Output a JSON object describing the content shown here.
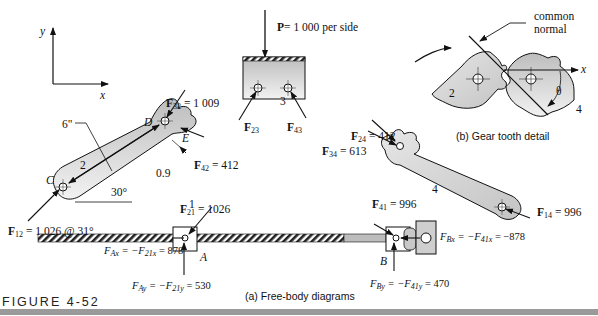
{
  "figure": {
    "number_label": "FIGURE 4-52",
    "caption_a": "(a)  Free-body diagrams",
    "caption_b": "(b) Gear tooth detail"
  },
  "axes": {
    "x_label": "x",
    "y_label": "y"
  },
  "slider_block": {
    "load_label": "P",
    "load_value": "= 1 000 per side",
    "link_number": "3",
    "force_23": "F",
    "force_23_sub": "23",
    "force_43": "F",
    "force_43_sub": "43"
  },
  "link2": {
    "link_number": "2",
    "point_c": "C",
    "point_d": "D",
    "point_e": "E",
    "length": "6\"",
    "offset": "0.9",
    "angle": "30°",
    "f32": {
      "sym": "F",
      "sub": "32",
      "value": " = 1 009"
    },
    "f42": {
      "sym": "F",
      "sub": "42",
      "value": " = 412"
    },
    "f12": {
      "sym": "F",
      "sub": "12",
      "value": " = 1 026 @ 31°"
    }
  },
  "link4": {
    "link_number": "4",
    "f24": {
      "sym": "F",
      "sub": "24",
      "value": " = 412"
    },
    "f34": {
      "sym": "F",
      "sub": "34",
      "value": " = 613"
    },
    "f14": {
      "sym": "F",
      "sub": "14",
      "value": " = 996"
    }
  },
  "link1": {
    "link_number": "1",
    "point_a": "A",
    "point_b": "B",
    "f21": {
      "sym": "F",
      "sub": "21",
      "value": " = 1026"
    },
    "f41": {
      "sym": "F",
      "sub": "41",
      "value": " = 996"
    },
    "fax": {
      "lhs": "F",
      "lhs_sub": "Ax",
      "mid": " = −F",
      "mid_sub": "21x",
      "value": " = 878"
    },
    "fay": {
      "lhs": "F",
      "lhs_sub": "Ay",
      "mid": " = −F",
      "mid_sub": "21y",
      "value": " = 530"
    },
    "fbx": {
      "lhs": "F",
      "lhs_sub": "Bx",
      "mid": " = −F",
      "mid_sub": "41x",
      "value": " = −878"
    },
    "fby": {
      "lhs": "F",
      "lhs_sub": "By",
      "mid": " = −F",
      "mid_sub": "41y",
      "value": " = 470"
    }
  },
  "gear_detail": {
    "label_common": "common",
    "label_normal": "normal",
    "gear_left": "2",
    "gear_right": "4",
    "angle": "θ",
    "x_label": "x"
  },
  "colors": {
    "part_fill": "#cfcfcf",
    "part_fill_light": "#ececec",
    "stroke": "#1a1a1a",
    "rule": "#9a9a9a"
  }
}
